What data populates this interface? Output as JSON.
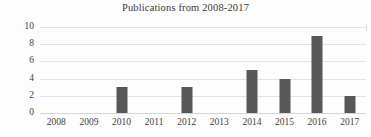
{
  "chart_data": {
    "type": "bar",
    "title": "Publications from 2008-2017",
    "xlabel": "",
    "ylabel": "",
    "categories": [
      "2008",
      "2009",
      "2010",
      "2011",
      "2012",
      "2013",
      "2014",
      "2015",
      "2016",
      "2017"
    ],
    "values": [
      0,
      0,
      3,
      0,
      3,
      0,
      5,
      4,
      9,
      2
    ],
    "series": [
      {
        "name": "Publications",
        "values": [
          0,
          0,
          3,
          0,
          3,
          0,
          5,
          4,
          9,
          2
        ]
      }
    ],
    "ylim": [
      0,
      10
    ],
    "yticks": [
      0,
      2,
      4,
      6,
      8,
      10
    ],
    "ytick_labels": [
      "0",
      "2",
      "4",
      "6",
      "8",
      "10"
    ],
    "grid": true,
    "grid_axis": "y",
    "legend": false,
    "legend_position": "none",
    "bar_color": "#585858",
    "gridline_color": "#e3e3e3",
    "background_color": "#fdfdfd",
    "text_color": "#3f3f3f"
  }
}
